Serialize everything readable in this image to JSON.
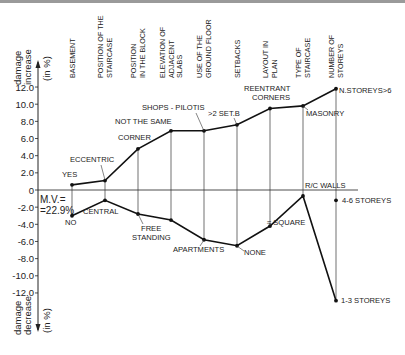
{
  "chart_data": {
    "type": "line",
    "title": "",
    "ylabel_top": [
      "damage",
      "increase",
      "(in %)"
    ],
    "ylabel_bottom": [
      "damage",
      "decrease",
      "(in %)"
    ],
    "ylim": [
      -14,
      13
    ],
    "yticks": [
      12.0,
      10.0,
      8.0,
      6.0,
      4.0,
      2.0,
      0,
      -2.0,
      -4.0,
      -6.0,
      -8.0,
      -10.0,
      -12.0
    ],
    "ytick_labels": [
      "12.0",
      "10.0",
      "8.0",
      "6.0",
      "4.0",
      "2.0",
      "0",
      "-2.0",
      "-4.0",
      "-6.0",
      "-8.0",
      "-10.0",
      "-12.0"
    ],
    "grid": false,
    "categories": [
      [
        "BASEMENT"
      ],
      [
        "POSITION OF THE",
        "STAIRCASE"
      ],
      [
        "POSITION",
        "IN THE BLOCK"
      ],
      [
        "ELEVATION OF",
        "ADJACENT",
        "SLABS"
      ],
      [
        "USE OF THE",
        "GROUND FLOOR"
      ],
      [
        "SETBACKS"
      ],
      [
        "LAYOUT IN",
        "PLAN"
      ],
      [
        "TYPE OF",
        "STAIRCASE"
      ],
      [
        "NUMBER OF",
        "STOREYS"
      ]
    ],
    "series": [
      {
        "name": "damage increase",
        "values": [
          0.6,
          1.1,
          4.8,
          6.9,
          6.9,
          7.6,
          9.5,
          9.8,
          11.8
        ],
        "point_labels": [
          "YES",
          "ECCENTRIC",
          "CORNER",
          "NOT THE SAME",
          "SHOPS - PILOTIS",
          ">2 SET.B",
          "REENTRANT CORNERS",
          "MASONRY",
          "N.STOREYS>6"
        ]
      },
      {
        "name": "damage decrease",
        "values": [
          -3.0,
          -1.2,
          -2.8,
          -3.5,
          -5.8,
          -6.5,
          -4.2,
          -0.7,
          -12.9
        ],
        "point_labels": [
          "NO",
          "CENTRAL",
          "FREE STANDING",
          "",
          "APARTMENTS",
          "NONE",
          "≈ SQUARE",
          "R/C WALLS",
          "1-3 STOREYS"
        ]
      }
    ],
    "extra_points": [
      {
        "category": "NUMBER OF STOREYS",
        "value": -1.2,
        "label": "4-6 STOREYS"
      }
    ],
    "annotations": [
      "M.V.=",
      "=22.9%"
    ]
  },
  "labels": {
    "mv_line1": "M.V.=",
    "mv_line2": "=22.9%",
    "up": [
      "damage",
      "increase",
      "(in %)"
    ],
    "down": [
      "damage",
      "decrease",
      "(in %)"
    ]
  }
}
